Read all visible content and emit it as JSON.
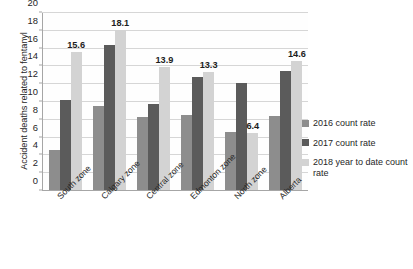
{
  "chart_data": {
    "type": "bar",
    "title": "",
    "xlabel": "",
    "ylabel": "Accident deaths related to fentanyl",
    "ylim": [
      0,
      20
    ],
    "ytick_step": 2,
    "ytick_labels": [
      "0",
      "2",
      "4",
      "6",
      "8",
      "10",
      "12",
      "14",
      "16",
      "18",
      "20"
    ],
    "grid": "horizontal",
    "legend_position": "right",
    "orientation": "vertical",
    "grouping": "clustered",
    "categories": [
      "South zone",
      "Calgary zone",
      "Central zone",
      "Edmonton zone",
      "North zone",
      "Alberta"
    ],
    "series": [
      {
        "name": "2016 count rate",
        "color": "#8d8d8d",
        "values": [
          4.5,
          9.5,
          8.2,
          8.5,
          6.5,
          8.4
        ],
        "labels": [
          "",
          "",
          "",
          "",
          "",
          ""
        ]
      },
      {
        "name": "2017 count rate",
        "color": "#5b5b5b",
        "values": [
          10.2,
          16.4,
          9.7,
          12.8,
          12.1,
          13.5
        ],
        "labels": [
          "",
          "",
          "",
          "",
          "",
          ""
        ]
      },
      {
        "name": "2018 year to date count rate",
        "color": "#d3d3d3",
        "values": [
          15.6,
          18.1,
          13.9,
          13.3,
          6.4,
          14.6
        ],
        "labels": [
          "15.6",
          "18.1",
          "13.9",
          "13.3",
          "6.4",
          "14.6"
        ]
      }
    ],
    "annotations": [
      {
        "text": "15.6",
        "series": "2018 year to date count rate",
        "category": "South zone"
      },
      {
        "text": "18.1",
        "series": "2018 year to date count rate",
        "category": "Calgary zone"
      },
      {
        "text": "13.9",
        "series": "2018 year to date count rate",
        "category": "Central zone"
      },
      {
        "text": "13.3",
        "series": "2018 year to date count rate",
        "category": "Edmonton zone"
      },
      {
        "text": "6.4",
        "series": "2018 year to date count rate",
        "category": "North zone"
      },
      {
        "text": "14.6",
        "series": "2018 year to date count rate",
        "category": "Alberta"
      }
    ]
  },
  "legend": {
    "items": [
      {
        "label": "2016 count rate"
      },
      {
        "label": "2017 count rate"
      },
      {
        "label": "2018 year to date count rate"
      }
    ]
  },
  "colors": {
    "series_2016": "#8d8d8d",
    "series_2017": "#5b5b5b",
    "series_2018": "#d3d3d3",
    "gridline": "#d6d6d6",
    "axis": "#a6a6a6",
    "text": "#262626",
    "background": "#ffffff"
  }
}
